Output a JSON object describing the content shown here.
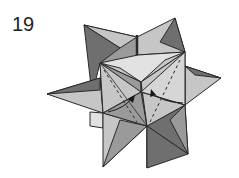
{
  "diagram": {
    "step_number": "19",
    "annotations": [
      "valley-fold dashed lines on front faces",
      "two curved fold arrows"
    ],
    "colors": {
      "dark": "#6f6f6f",
      "mid": "#9a9a9a",
      "light": "#c6c6c6",
      "lightest": "#e2e2e2",
      "stroke": "#2a2a2a"
    }
  }
}
